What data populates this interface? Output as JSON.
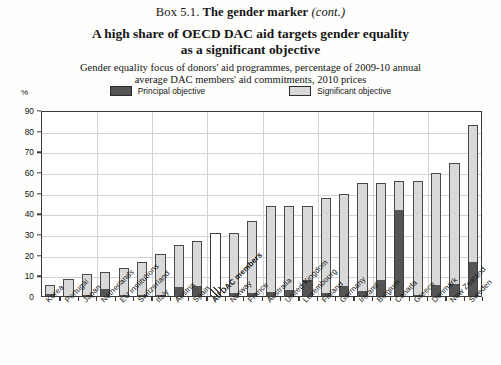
{
  "box": {
    "prefix": "Box 5.1.",
    "name": "The gender marker",
    "cont": "(cont.)"
  },
  "title": "A high share of OECD DAC aid targets gender equality as a significant objective",
  "title_line1": "A high share of OECD DAC aid targets gender equality",
  "title_line2": "as a significant objective",
  "subtitle_line1": "Gender equality focus of donors' aid programmes, percentage of 2009-10 annual",
  "subtitle_line2": "average DAC members' aid commitments, 2010 prices",
  "axis_unit": "%",
  "legend": [
    {
      "label": "Principal objective",
      "swatch": "principal",
      "color": "#555555"
    },
    {
      "label": "Significant objective",
      "swatch": "significant",
      "color": "#d8d8d8"
    }
  ],
  "chart_data": {
    "type": "bar",
    "stacked": true,
    "title": "A high share of OECD DAC aid targets gender equality as a significant objective",
    "subtitle": "Gender equality focus of donors' aid programmes, percentage of 2009-10 annual average DAC members' aid commitments, 2010 prices",
    "xlabel": "",
    "ylabel": "%",
    "ylim": [
      0,
      90
    ],
    "yticks": [
      0,
      10,
      20,
      30,
      40,
      50,
      60,
      70,
      80,
      90
    ],
    "grid": true,
    "legend_position": "top",
    "categories": [
      "Korea",
      "Portugal",
      "Japan",
      "Netherlands",
      "EU institutions",
      "Switzerland",
      "Italy",
      "Austria",
      "Spain",
      "All DAC members",
      "Norway",
      "France",
      "Australia",
      "United Kingdom",
      "Luxembourg",
      "Finland",
      "Germany",
      "Ireland",
      "Belgium",
      "Canada",
      "Greece",
      "Denmark",
      "New Zealand",
      "Sweden"
    ],
    "highlight_category": "All DAC members",
    "series": [
      {
        "name": "Principal objective",
        "color": "#555555",
        "values": [
          1.5,
          0.5,
          1.0,
          4.0,
          1.0,
          1.0,
          1.0,
          5.0,
          5.5,
          5.0,
          2.0,
          2.0,
          2.5,
          3.5,
          8.0,
          2.0,
          5.5,
          3.0,
          8.0,
          42.0,
          1.0,
          6.0,
          6.5,
          17.0
        ]
      },
      {
        "name": "Significant objective",
        "color": "#d9d9d9",
        "values": [
          4.5,
          8.0,
          10.0,
          8.0,
          13.0,
          16.0,
          20.0,
          20.0,
          21.5,
          26.0,
          29.0,
          35.0,
          41.5,
          40.5,
          36.0,
          46.0,
          44.5,
          52.0,
          47.0,
          14.0,
          55.0,
          54.0,
          58.5,
          66.0
        ]
      }
    ],
    "totals": [
      6,
      8.5,
      11,
      12,
      14,
      17,
      21,
      25,
      27,
      31,
      31,
      37,
      44,
      44,
      44,
      48,
      50,
      55,
      55,
      56,
      56,
      60,
      65,
      83
    ]
  }
}
